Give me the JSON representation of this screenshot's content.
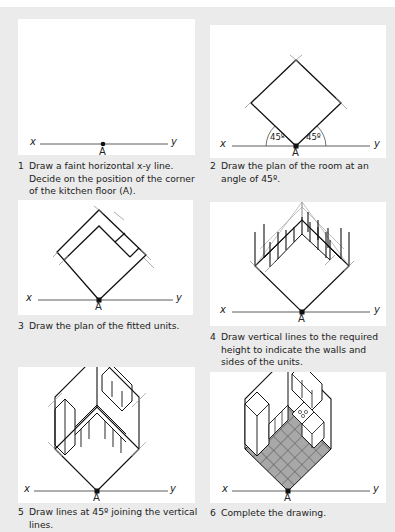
{
  "steps": [
    {
      "number": "1",
      "caption": "Draw a faint horizontal x-y line. Decide on the position of the corner of the kitchen floor (A)."
    },
    {
      "number": "2",
      "caption": "Draw the plan of the room at an angle of 45º."
    },
    {
      "number": "3",
      "caption": "Draw the plan of the fitted units."
    },
    {
      "number": "4",
      "caption": "Draw vertical lines to the required height to indicate the walls and sides of the units."
    },
    {
      "number": "5",
      "caption": "Draw lines at 45º joining the vertical lines."
    },
    {
      "number": "6",
      "caption": "Complete the drawing."
    }
  ],
  "labels": {
    "x": "x",
    "y": "y",
    "point": "A",
    "angle": "45º"
  },
  "colors": {
    "page_bg": "#ebebeb",
    "panel_bg": "#ffffff",
    "line": "#222222",
    "faint_line": "#999999",
    "floor_tile": "#a8a8a8"
  }
}
